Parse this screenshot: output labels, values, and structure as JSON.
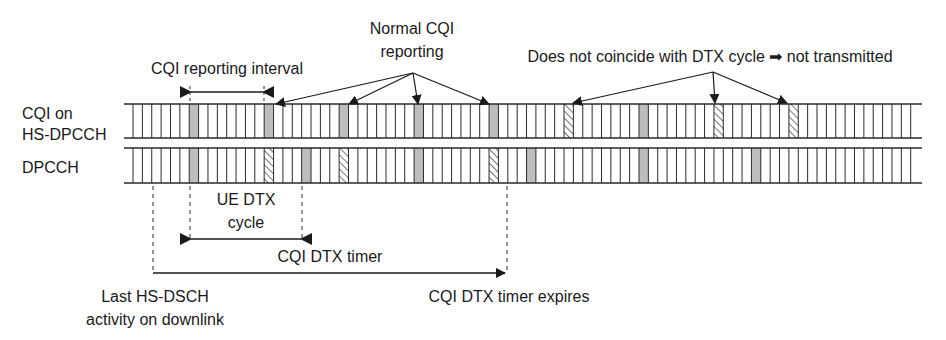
{
  "diagram": {
    "rows": [
      {
        "id": "cqi",
        "label_lines": [
          "CQI on",
          "HS-DPCCH"
        ]
      },
      {
        "id": "dpcch",
        "label_lines": [
          "DPCCH"
        ]
      }
    ],
    "grid": {
      "cell_count": 84,
      "cell_width_px": 9.37,
      "first_line_x": 133
    },
    "cqi_cells": {
      "transmitted": [
        6,
        14,
        22,
        30,
        38,
        54
      ],
      "not_transmitted": [
        46,
        62,
        70
      ]
    },
    "dpcch_cells": {
      "dtx_cycle": [
        6,
        18,
        30,
        42,
        54,
        66
      ],
      "cqi_triggered": [
        14,
        22,
        38
      ]
    },
    "annotations": {
      "cqi_reporting_interval": "CQI reporting interval",
      "normal_cqi_line1": "Normal CQI",
      "normal_cqi_line2": "reporting",
      "not_transmitted": "Does not coincide with DTX cycle ➡ not transmitted",
      "ue_dtx_line1": "UE DTX",
      "ue_dtx_line2": "cycle",
      "cqi_dtx_timer": "CQI DTX timer",
      "last_activity_line1": "Last HS-DSCH",
      "last_activity_line2": "activity on downlink",
      "timer_expires": "CQI DTX timer expires"
    },
    "colors": {
      "line": "#2a2a2a",
      "gray_fill": "#bdbdbd",
      "hatch": "#2a2a2a",
      "text": "#1a1a1a"
    }
  }
}
